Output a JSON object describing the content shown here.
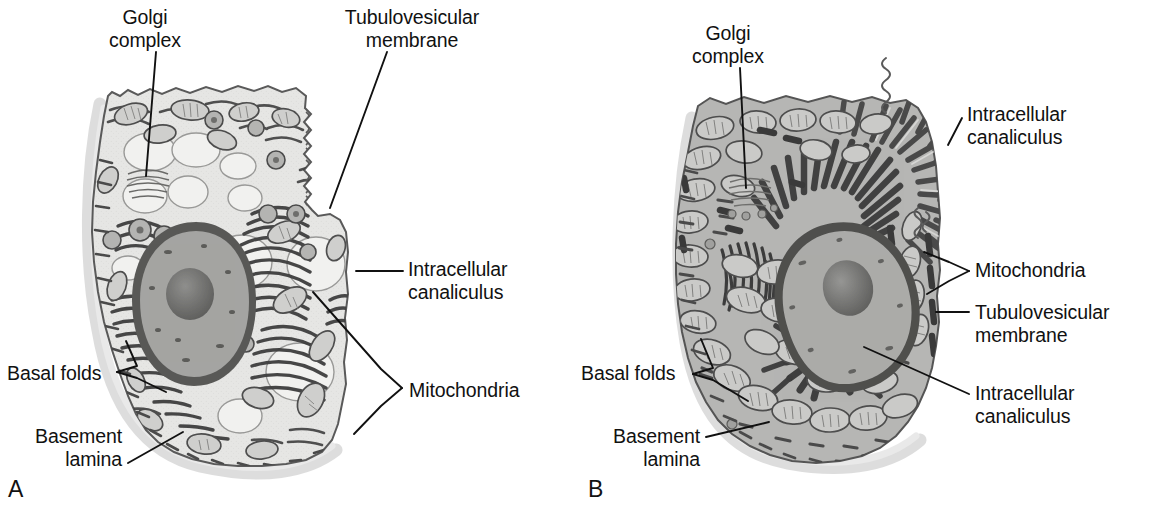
{
  "figure": {
    "type": "scientific-illustration",
    "background_color": "#ffffff",
    "ink_color": "#111111"
  },
  "palette": {
    "cytoplasm_light": "#e9e9e7",
    "cytoplasm_mid": "#b8b8b6",
    "membrane_dark": "#4a4a4a",
    "membrane_darker": "#3a3a3a",
    "nucleus_fill": "#9a9a98",
    "nucleus_envelope": "#6a6a6a",
    "nucleolus": "#6e6e6e",
    "mitochondria_fill": "#cfcfcd",
    "canaliculus_fill": "#efefed",
    "basement_haze": "#cfcfcf"
  },
  "panels": [
    {
      "id": "A",
      "letter": "A",
      "letter_pos": {
        "x": 8,
        "y": 478
      },
      "state": "resting parietal cell",
      "labels": [
        {
          "id": "golgi-complex",
          "text": "Golgi\ncomplex",
          "align": "center",
          "x": 103,
          "y": 6,
          "w": 84,
          "leader": {
            "points": "156,52 146,176"
          }
        },
        {
          "id": "tubulovesicular-membrane",
          "text": "Tubulovesicular\nmembrane",
          "align": "center",
          "x": 325,
          "y": 6,
          "w": 174,
          "leader": {
            "points": "387,52 330,208"
          }
        },
        {
          "id": "intracellular-canaliculus",
          "text": "Intracellular\ncanaliculus",
          "align": "left",
          "x": 408,
          "y": 258,
          "w": 150,
          "leader": {
            "points": "403,271 356,271"
          }
        },
        {
          "id": "mitochondria",
          "text": "Mitochondria",
          "align": "left",
          "x": 409,
          "y": 379,
          "w": 150,
          "leader_fork": {
            "points": "402,388 381,369 313,292"
          },
          "leader_fork2": {
            "points": "402,388 381,406 354,434"
          }
        },
        {
          "id": "basal-folds",
          "text": "Basal folds",
          "align": "left",
          "x": 7,
          "y": 362,
          "w": 120,
          "leader_fork": {
            "points": "117,372 137,366 126,341"
          },
          "leader_fork2": {
            "points": "117,372 137,378 166,392"
          }
        },
        {
          "id": "basement-lamina",
          "text": "Basement\nlamina",
          "align": "right",
          "x": 4,
          "y": 425,
          "w": 118,
          "leader": {
            "points": "128,463 183,432"
          }
        }
      ]
    },
    {
      "id": "B",
      "letter": "B",
      "letter_pos": {
        "x": 8,
        "y": 478
      },
      "state": "stimulated parietal cell",
      "labels": [
        {
          "id": "golgi-complex",
          "text": "Golgi\ncomplex",
          "align": "center",
          "x": 106,
          "y": 22,
          "w": 84,
          "leader": {
            "points": "160,68 166,188"
          }
        },
        {
          "id": "intracellular-canaliculus-apical",
          "text": "Intracellular\ncanaliculus",
          "align": "left",
          "x": 387,
          "y": 103,
          "w": 152,
          "leader": {
            "points": "382,118 368,145"
          }
        },
        {
          "id": "mitochondria",
          "text": "Mitochondria",
          "align": "left",
          "x": 395,
          "y": 259,
          "w": 150,
          "leader_fork": {
            "points": "389,271 369,262 344,252"
          },
          "leader_fork2": {
            "points": "389,271 369,281 347,294"
          }
        },
        {
          "id": "tubulovesicular-membrane",
          "text": "Tubulovesicular\nmembrane",
          "align": "left",
          "x": 395,
          "y": 301,
          "w": 165,
          "leader": {
            "points": "389,312 356,312"
          }
        },
        {
          "id": "intracellular-canaliculus-basal",
          "text": "Intracellular\ncanaliculus",
          "align": "left",
          "x": 395,
          "y": 382,
          "w": 152,
          "leader": {
            "points": "389,394 284,347"
          }
        },
        {
          "id": "basal-folds",
          "text": "Basal folds",
          "align": "left",
          "x": 1,
          "y": 362,
          "w": 120,
          "leader_fork": {
            "points": "113,374 133,368 121,339"
          },
          "leader_fork2": {
            "points": "113,374 133,380 168,401"
          }
        },
        {
          "id": "basement-lamina",
          "text": "Basement\nlamina",
          "align": "right",
          "x": 0,
          "y": 425,
          "w": 120,
          "leader": {
            "points": "126,437 189,422"
          }
        }
      ]
    }
  ]
}
